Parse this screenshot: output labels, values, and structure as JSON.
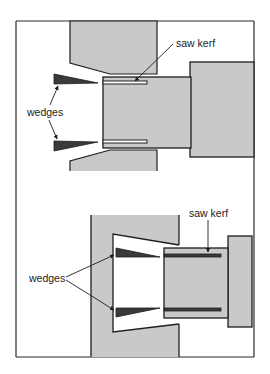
{
  "figure": {
    "colors": {
      "background": "#ffffff",
      "wood_fill": "#c9c9c9",
      "outline": "#1e1e1e",
      "wedge_fill": "#3a3a3a",
      "frame": "#2a2a2a"
    }
  },
  "top_panel": {
    "labels": {
      "saw_kerf": "saw kerf",
      "wedges": "wedges"
    }
  },
  "bottom_panel": {
    "labels": {
      "saw_kerf": "saw kerf",
      "wedges": "wedges"
    }
  }
}
